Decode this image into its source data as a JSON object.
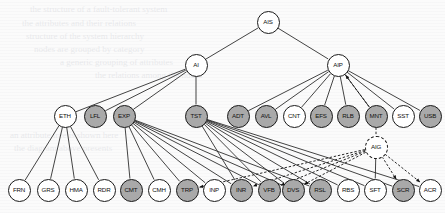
{
  "diagram": {
    "type": "tree",
    "canvas": {
      "width": 445,
      "height": 213
    },
    "colors": {
      "node_fill_highlight": "#a9a9a9",
      "node_fill_plain": "#ffffff",
      "node_stroke": "#1a1a1a",
      "edge_solid": "#222222",
      "edge_dashed": "#111111",
      "background": "#fbfbfb"
    },
    "legend_note": "Shaded (gray) circles denote highlighted nodes; dashed circle and dashed edges denote the AIG overlay grouping.",
    "nodes": [
      {
        "id": "AIS",
        "label": "AIS",
        "x": 268,
        "y": 22,
        "r": 11.5,
        "fill": "plain",
        "border": "solid",
        "level": 0
      },
      {
        "id": "AI",
        "label": "AI",
        "x": 196,
        "y": 65,
        "r": 11.5,
        "fill": "plain",
        "border": "solid",
        "level": 1
      },
      {
        "id": "AIP",
        "label": "AIP",
        "x": 338,
        "y": 65,
        "r": 11.5,
        "fill": "plain",
        "border": "solid",
        "level": 1
      },
      {
        "id": "ETH",
        "label": "ETH",
        "x": 65,
        "y": 116,
        "r": 11.5,
        "fill": "plain",
        "border": "solid",
        "level": 2
      },
      {
        "id": "LFL",
        "label": "LFL",
        "x": 95,
        "y": 116,
        "r": 11.5,
        "fill": "highlight",
        "border": "solid",
        "level": 2
      },
      {
        "id": "EXP",
        "label": "EXP",
        "x": 124,
        "y": 116,
        "r": 11.5,
        "fill": "highlight",
        "border": "solid",
        "level": 2
      },
      {
        "id": "TST",
        "label": "TST",
        "x": 196,
        "y": 116,
        "r": 11.5,
        "fill": "highlight",
        "border": "solid",
        "level": 2
      },
      {
        "id": "ADT",
        "label": "ADT",
        "x": 238,
        "y": 116,
        "r": 11.5,
        "fill": "highlight",
        "border": "solid",
        "level": 2
      },
      {
        "id": "AVL",
        "label": "AVL",
        "x": 266,
        "y": 116,
        "r": 11.5,
        "fill": "highlight",
        "border": "solid",
        "level": 2
      },
      {
        "id": "CNT",
        "label": "CNT",
        "x": 294,
        "y": 116,
        "r": 11.5,
        "fill": "plain",
        "border": "solid",
        "level": 2
      },
      {
        "id": "EFS",
        "label": "EFS",
        "x": 321,
        "y": 116,
        "r": 11.5,
        "fill": "highlight",
        "border": "solid",
        "level": 2
      },
      {
        "id": "RLB",
        "label": "RLB",
        "x": 348,
        "y": 116,
        "r": 11.5,
        "fill": "highlight",
        "border": "solid",
        "level": 2
      },
      {
        "id": "MNT",
        "label": "MNT",
        "x": 376,
        "y": 116,
        "r": 11.5,
        "fill": "highlight",
        "border": "solid",
        "level": 2
      },
      {
        "id": "SST",
        "label": "SST",
        "x": 403,
        "y": 116,
        "r": 11.5,
        "fill": "plain",
        "border": "solid",
        "level": 2
      },
      {
        "id": "USB",
        "label": "USB",
        "x": 430,
        "y": 116,
        "r": 11.5,
        "fill": "highlight",
        "border": "solid",
        "level": 2
      },
      {
        "id": "AIG",
        "label": "AIG",
        "x": 376,
        "y": 147,
        "r": 11.5,
        "fill": "plain",
        "border": "dashed",
        "level": 3
      },
      {
        "id": "FRN",
        "label": "FRN",
        "x": 19,
        "y": 190,
        "r": 11.5,
        "fill": "plain",
        "border": "solid",
        "level": 4
      },
      {
        "id": "GRS",
        "label": "GRS",
        "x": 48,
        "y": 190,
        "r": 11.5,
        "fill": "plain",
        "border": "solid",
        "level": 4
      },
      {
        "id": "HMA",
        "label": "HMA",
        "x": 76,
        "y": 190,
        "r": 11.5,
        "fill": "plain",
        "border": "solid",
        "level": 4
      },
      {
        "id": "RDR",
        "label": "RDR",
        "x": 104,
        "y": 190,
        "r": 11.5,
        "fill": "plain",
        "border": "solid",
        "level": 4
      },
      {
        "id": "CMT",
        "label": "CMT",
        "x": 131,
        "y": 190,
        "r": 11.5,
        "fill": "highlight",
        "border": "solid",
        "level": 4
      },
      {
        "id": "CMH",
        "label": "CMH",
        "x": 159,
        "y": 190,
        "r": 11.5,
        "fill": "plain",
        "border": "solid",
        "level": 4
      },
      {
        "id": "TRP",
        "label": "TRP",
        "x": 187,
        "y": 190,
        "r": 11.5,
        "fill": "highlight",
        "border": "solid",
        "level": 4
      },
      {
        "id": "INP",
        "label": "INP",
        "x": 214,
        "y": 190,
        "r": 11.5,
        "fill": "plain",
        "border": "solid",
        "level": 4
      },
      {
        "id": "INR",
        "label": "INR",
        "x": 241,
        "y": 190,
        "r": 11.5,
        "fill": "highlight",
        "border": "solid",
        "level": 4
      },
      {
        "id": "VFB",
        "label": "VFB",
        "x": 269,
        "y": 190,
        "r": 11.5,
        "fill": "highlight",
        "border": "solid",
        "level": 4
      },
      {
        "id": "DVS",
        "label": "DVS",
        "x": 293,
        "y": 190,
        "r": 11.5,
        "fill": "highlight",
        "border": "solid",
        "level": 4
      },
      {
        "id": "RSL",
        "label": "RSL",
        "x": 320,
        "y": 190,
        "r": 11.5,
        "fill": "highlight",
        "border": "solid",
        "level": 4
      },
      {
        "id": "RBS",
        "label": "RBS",
        "x": 348,
        "y": 190,
        "r": 11.5,
        "fill": "plain",
        "border": "solid",
        "level": 4
      },
      {
        "id": "SFT",
        "label": "SFT",
        "x": 375,
        "y": 190,
        "r": 11.5,
        "fill": "plain",
        "border": "solid",
        "level": 4
      },
      {
        "id": "SCR",
        "label": "SCR",
        "x": 403,
        "y": 190,
        "r": 11.5,
        "fill": "highlight",
        "border": "solid",
        "level": 4
      },
      {
        "id": "ACR",
        "label": "ACR",
        "x": 430,
        "y": 190,
        "r": 11.5,
        "fill": "plain",
        "border": "solid",
        "level": 4
      }
    ],
    "edges_solid": [
      {
        "from": "AIS",
        "to": "AI"
      },
      {
        "from": "AIS",
        "to": "AIP"
      },
      {
        "from": "AI",
        "to": "ETH"
      },
      {
        "from": "AI",
        "to": "LFL"
      },
      {
        "from": "AI",
        "to": "EXP"
      },
      {
        "from": "AI",
        "to": "TST"
      },
      {
        "from": "AIP",
        "to": "ADT"
      },
      {
        "from": "AIP",
        "to": "AVL"
      },
      {
        "from": "AIP",
        "to": "CNT"
      },
      {
        "from": "AIP",
        "to": "EFS"
      },
      {
        "from": "AIP",
        "to": "RLB"
      },
      {
        "from": "AIP",
        "to": "MNT"
      },
      {
        "from": "AIP",
        "to": "SST"
      },
      {
        "from": "AIP",
        "to": "USB"
      },
      {
        "from": "ETH",
        "to": "FRN"
      },
      {
        "from": "ETH",
        "to": "GRS"
      },
      {
        "from": "ETH",
        "to": "HMA"
      },
      {
        "from": "ETH",
        "to": "RDR"
      },
      {
        "from": "EXP",
        "to": "CMT"
      },
      {
        "from": "EXP",
        "to": "CMH"
      },
      {
        "from": "EXP",
        "to": "TRP"
      },
      {
        "from": "EXP",
        "to": "INP"
      },
      {
        "from": "EXP",
        "to": "INR"
      },
      {
        "from": "EXP",
        "to": "VFB"
      },
      {
        "from": "EXP",
        "to": "DVS"
      },
      {
        "from": "EXP",
        "to": "RSL"
      },
      {
        "from": "TST",
        "to": "INR"
      },
      {
        "from": "TST",
        "to": "VFB"
      },
      {
        "from": "TST",
        "to": "DVS"
      },
      {
        "from": "TST",
        "to": "RSL"
      },
      {
        "from": "TST",
        "to": "RBS"
      },
      {
        "from": "TST",
        "to": "SFT"
      },
      {
        "from": "TST",
        "to": "SCR"
      },
      {
        "from": "TST",
        "to": "ACR"
      },
      {
        "from": "AIG",
        "to": "SFT"
      }
    ],
    "edges_dashed": [
      {
        "from": "MNT",
        "to": "AIP",
        "arrow": "to"
      },
      {
        "from": "MNT",
        "to": "AIG",
        "arrow": "none"
      },
      {
        "from": "AIG",
        "to": "TRP",
        "arrow": "to"
      },
      {
        "from": "AIG",
        "to": "INR",
        "arrow": "to"
      },
      {
        "from": "AIG",
        "to": "VFB",
        "arrow": "to"
      },
      {
        "from": "AIG",
        "to": "DVS",
        "arrow": "to"
      },
      {
        "from": "AIG",
        "to": "SCR",
        "arrow": "to"
      },
      {
        "from": "AIG",
        "to": "ACR",
        "arrow": "to"
      }
    ]
  },
  "background_artifacts": {
    "note": "Faint bleed-through text from reverse page of scanned document",
    "lines": [
      {
        "text": "the structure of a fault-tolerant system",
        "x": 30,
        "y": 4
      },
      {
        "text": "the attributes and their relations",
        "x": 22,
        "y": 18
      },
      {
        "text": "structure of the system hierarchy",
        "x": 26,
        "y": 31
      },
      {
        "text": "nodes are grouped by category",
        "x": 34,
        "y": 44
      },
      {
        "text": "a generic grouping of attributes",
        "x": 60,
        "y": 57
      },
      {
        "text": "the relations among the nodes",
        "x": 95,
        "y": 70
      },
      {
        "text": "an attribute tree is shown here",
        "x": 10,
        "y": 130
      },
      {
        "text": "the diagram above presents",
        "x": 14,
        "y": 143
      }
    ]
  }
}
